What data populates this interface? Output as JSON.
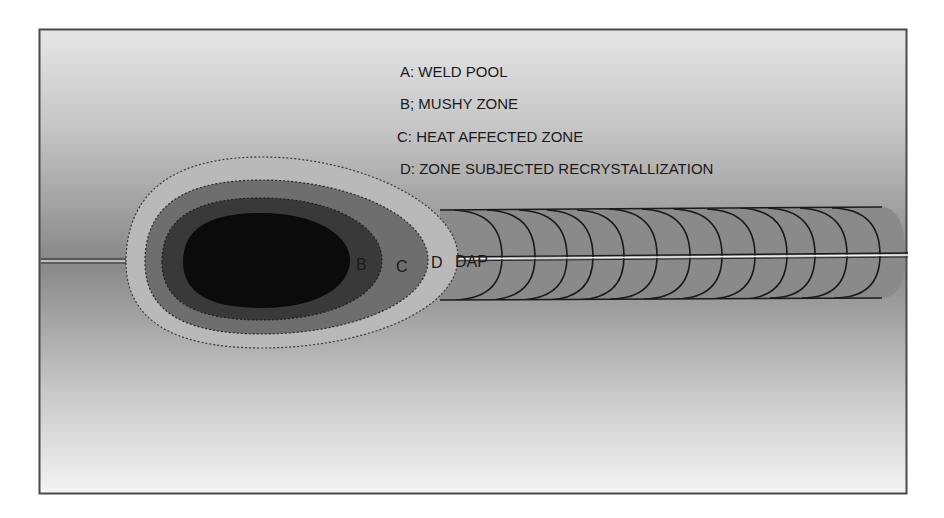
{
  "figure": {
    "colors": {
      "frame_border": "#4a4a4a",
      "background_top": "#e4e4e4",
      "background_mid": "#8c8c8c",
      "background_bottom": "#f2f2f2",
      "zone_A_weld_pool": "#0b0b0b",
      "zone_B_mushy": "#393939",
      "zone_C_haz": "#6e6e6e",
      "zone_D_recrystallization": "#b9b9b9",
      "bead_fill": "#8a8a8a",
      "ripple_line": "#1a1a1a",
      "seam_highlight": "#f0f0f0"
    }
  },
  "legend": {
    "items": [
      {
        "key": "A",
        "text": "A: WELD POOL"
      },
      {
        "key": "B",
        "text": "B; MUSHY ZONE"
      },
      {
        "key": "C",
        "text": "C: HEAT AFFECTED ZONE"
      },
      {
        "key": "D",
        "text": "D: ZONE SUBJECTED RECRYSTALLIZATION"
      }
    ]
  },
  "zone_labels": {
    "b": "B",
    "c": "C",
    "d": "D",
    "dap": "DAP"
  },
  "bead": {
    "ripple_count": 13
  }
}
